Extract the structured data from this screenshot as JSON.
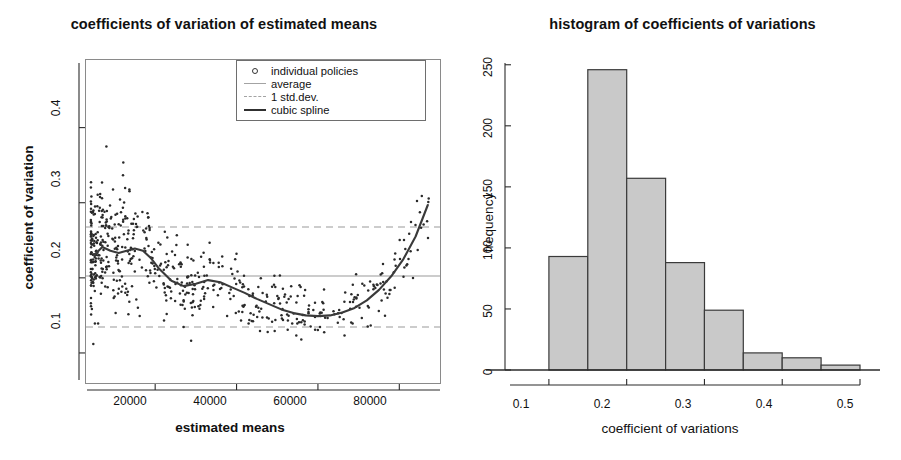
{
  "figure": {
    "panels": [
      "scatter",
      "histogram"
    ]
  },
  "scatter": {
    "title": "coefficients of variation of estimated means",
    "xlabel": "estimated means",
    "ylabel": "coefficient of variation",
    "xticks": [
      "20000",
      "40000",
      "60000",
      "80000"
    ],
    "yticks": [
      "0.1",
      "0.2",
      "0.3",
      "0.4"
    ],
    "legend": [
      {
        "key": "open-circle",
        "label": "individual policies"
      },
      {
        "key": "solid-light-line",
        "label": "average"
      },
      {
        "key": "dashed-light-line",
        "label": "1 std.dev."
      },
      {
        "key": "solid-dark-line",
        "label": "cubic spline"
      }
    ]
  },
  "histogram": {
    "title": "histogram of coefficients of variations",
    "xlabel": "coefficient of variations",
    "ylabel": "frequency",
    "xticks": [
      "0.1",
      "0.2",
      "0.3",
      "0.4",
      "0.5"
    ],
    "yticks": [
      "0",
      "50",
      "100",
      "150",
      "200",
      "250"
    ]
  },
  "colors": {
    "bar_fill": "#c9c9c9",
    "bar_stroke": "#3a3a3a",
    "spline": "#3a3a3a",
    "reference_line": "#9a9a9a",
    "point": "#2a2a2a",
    "frame": "#8a8a8a"
  },
  "chart_data": [
    {
      "type": "scatter",
      "id": "coefficients-of-variation-scatter",
      "title": "coefficients of variation of estimated means",
      "xlabel": "estimated means",
      "ylabel": "coefficient of variation",
      "xlim": [
        3000,
        90000
      ],
      "ylim": [
        0.06,
        0.49
      ],
      "xticks": [
        20000,
        40000,
        60000,
        80000
      ],
      "yticks": [
        0.1,
        0.2,
        0.3,
        0.4
      ],
      "grid": false,
      "legend_position": "top-right",
      "legend": [
        "individual policies",
        "average",
        "1 std.dev.",
        "cubic spline"
      ],
      "reference_lines": [
        {
          "name": "average",
          "y": 0.215,
          "style": "solid",
          "color": "#9a9a9a"
        },
        {
          "name": "average + 1 std.dev.",
          "y": 0.278,
          "style": "dashed",
          "color": "#9a9a9a"
        },
        {
          "name": "average - 1 std.dev.",
          "y": 0.15,
          "style": "dashed",
          "color": "#9a9a9a"
        }
      ],
      "series": [
        {
          "name": "cubic spline",
          "type": "line",
          "x": [
            5000,
            7000,
            9000,
            11000,
            13000,
            15000,
            17000,
            19000,
            21000,
            24000,
            27000,
            30000,
            33000,
            36000,
            39000,
            42000,
            45000,
            48000,
            51000,
            54000,
            57000,
            60000,
            63000,
            66000,
            69000,
            72000,
            75000,
            78000,
            81000,
            84000,
            87000
          ],
          "y": [
            0.23,
            0.241,
            0.236,
            0.233,
            0.236,
            0.239,
            0.236,
            0.226,
            0.212,
            0.196,
            0.189,
            0.192,
            0.197,
            0.194,
            0.187,
            0.18,
            0.172,
            0.165,
            0.158,
            0.153,
            0.15,
            0.149,
            0.15,
            0.154,
            0.16,
            0.17,
            0.184,
            0.202,
            0.225,
            0.255,
            0.297
          ]
        },
        {
          "name": "individual policies",
          "type": "points",
          "n_points": 620,
          "x_range": [
            4000,
            88000
          ],
          "y_range": [
            0.07,
            0.47
          ],
          "description": "dense cloud concentrated below 30000 with spread 0.10-0.47, thinning and narrowing toward 0.13-0.25 for larger estimated means"
        }
      ]
    },
    {
      "type": "bar",
      "id": "coefficients-of-variation-histogram",
      "title": "histogram of coefficients of variations",
      "xlabel": "coefficient of variations",
      "ylabel": "frequency",
      "xlim": [
        0.05,
        0.5
      ],
      "ylim": [
        0,
        258
      ],
      "xticks": [
        0.1,
        0.2,
        0.3,
        0.4,
        0.5
      ],
      "yticks": [
        0,
        50,
        100,
        150,
        200,
        250
      ],
      "grid": false,
      "bin_width": 0.05,
      "bin_edges": [
        0.1,
        0.15,
        0.2,
        0.25,
        0.3,
        0.35,
        0.4,
        0.45,
        0.5
      ],
      "categories": [
        "0.10-0.15",
        "0.15-0.20",
        "0.20-0.25",
        "0.25-0.30",
        "0.30-0.35",
        "0.35-0.40",
        "0.40-0.45",
        "0.45-0.50"
      ],
      "values": [
        93,
        246,
        157,
        88,
        49,
        14,
        10,
        4
      ]
    }
  ]
}
